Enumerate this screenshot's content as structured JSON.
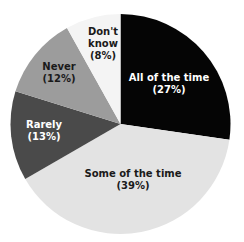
{
  "chart_data": {
    "type": "pie",
    "title": "",
    "start_angle_deg": 0,
    "direction": "clockwise",
    "slices": [
      {
        "label": "All of the time",
        "value": 27,
        "value_label": "(27%)",
        "color": "#050505",
        "text_color": "#ffffff",
        "label_pos": [
          169,
          84
        ]
      },
      {
        "label": "Some of the time",
        "value": 39,
        "value_label": "(39%)",
        "color": "#e3e3e3",
        "text_color": "#1a1a1a",
        "label_pos": [
          133,
          180
        ]
      },
      {
        "label": "Rarely",
        "value": 13,
        "value_label": "(13%)",
        "color": "#4a4a4a",
        "text_color": "#ffffff",
        "label_pos": [
          44,
          131
        ]
      },
      {
        "label": "Never",
        "value": 12,
        "value_label": "(12%)",
        "color": "#9c9c9c",
        "text_color": "#1a1a1a",
        "label_pos": [
          59,
          73
        ]
      },
      {
        "label": "Don't know",
        "value": 8,
        "value_label": "(8%)",
        "color": "#f4f4f4",
        "text_color": "#1a1a1a",
        "label_pos": [
          103,
          44
        ]
      }
    ],
    "center": [
      120.5,
      124
    ],
    "radius": 110
  }
}
